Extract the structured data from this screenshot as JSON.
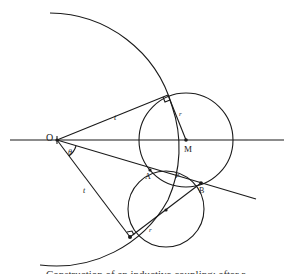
{
  "diagram": {
    "labels": {
      "O": "O",
      "M": "M",
      "A": "A",
      "B": "B",
      "P": "P",
      "theta": "θ",
      "t_upper": "t",
      "t_lower": "t",
      "r_upper": "r",
      "r_lower": "r"
    },
    "points": {
      "O": [
        57,
        140
      ],
      "M": [
        186,
        140
      ],
      "A": [
        150,
        170
      ],
      "B": [
        201,
        183
      ],
      "P": [
        175,
        177
      ],
      "T_upper": [
        168,
        95
      ],
      "T_lower": [
        130,
        237
      ],
      "C_lower": [
        166,
        210
      ]
    },
    "shapes": {
      "axis_line": {
        "x1": 10,
        "y1": 140,
        "x2": 284,
        "y2": 140
      },
      "upper_circle": {
        "cx": 186,
        "cy": 140,
        "r": 47
      },
      "lower_circle": {
        "cx": 166,
        "cy": 209,
        "r": 38
      },
      "large_arc_radius": 119
    },
    "caption": "Construction of an inductive coupling: after r"
  }
}
